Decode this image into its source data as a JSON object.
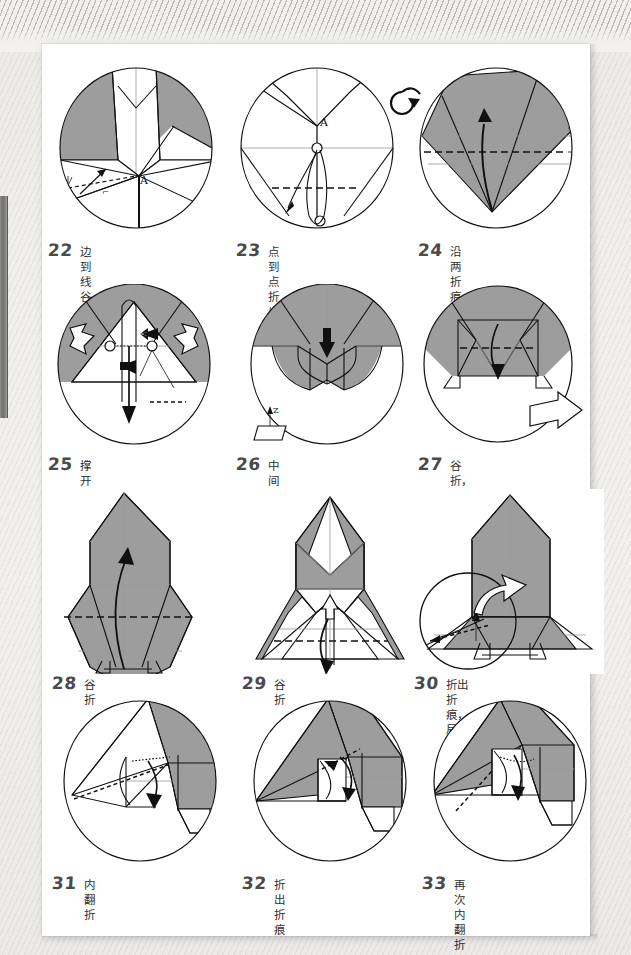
{
  "document": {
    "type": "origami-instruction-sheet",
    "language": "zh-CN",
    "colors": {
      "paper_front": "#9d9d9d",
      "paper_back": "#ffffff",
      "ink": "#101010",
      "crease_faint": "#9a9a9a",
      "page": "#ffffff",
      "background": "#ecebe9"
    }
  },
  "steps": [
    {
      "number": "22",
      "caption": "边到线谷折",
      "icons": [
        "valley-fold-arrow",
        "point-label-A"
      ],
      "point_label": "A"
    },
    {
      "number": "23",
      "caption": "点到点折出折痕后翻面",
      "icons": [
        "turn-over-icon",
        "point-label-A",
        "fold-and-unfold-arrow"
      ],
      "point_label": "A"
    },
    {
      "number": "24",
      "caption": "沿两折痕之间的等分线\n谷折",
      "icons": [
        "valley-fold-arrow",
        "bisector-measure-marks"
      ]
    },
    {
      "number": "25",
      "caption": "撑开压平",
      "icons": [
        "open-white-arrow-left",
        "open-white-arrow-right",
        "push-black-arrow",
        "squash-arrow",
        "hidden-crease-dotted"
      ]
    },
    {
      "number": "26",
      "caption": "中间过程",
      "icons": [
        "push-down-black-arrow",
        "z-axis-marker"
      ],
      "axis_label": "Z"
    },
    {
      "number": "27",
      "caption": "谷折，缩小视图",
      "icons": [
        "valley-fold-arrow",
        "zoom-out-white-arrow"
      ]
    },
    {
      "number": "28",
      "caption": "谷折",
      "icons": [
        "valley-fold-arrow",
        "valley-crease-dashed"
      ]
    },
    {
      "number": "29",
      "caption": "谷折",
      "icons": [
        "valley-fold-arrow-down",
        "small-white-arrow-up",
        "valley-crease-dashed"
      ]
    },
    {
      "number": "30",
      "caption": "折出折痕，局部放大",
      "icons": [
        "magnifier-circle",
        "zoom-in-white-arrow",
        "crease-arrow"
      ]
    },
    {
      "number": "31",
      "caption": "内翻折",
      "icons": [
        "inside-reverse-fold-arrow",
        "crease-dashed"
      ]
    },
    {
      "number": "32",
      "caption": "折出折痕",
      "icons": [
        "fold-unfold-arrow",
        "crease-dashed"
      ]
    },
    {
      "number": "33",
      "caption": "再次内翻折",
      "icons": [
        "inside-reverse-fold-arrow",
        "crease-dashed"
      ]
    }
  ]
}
